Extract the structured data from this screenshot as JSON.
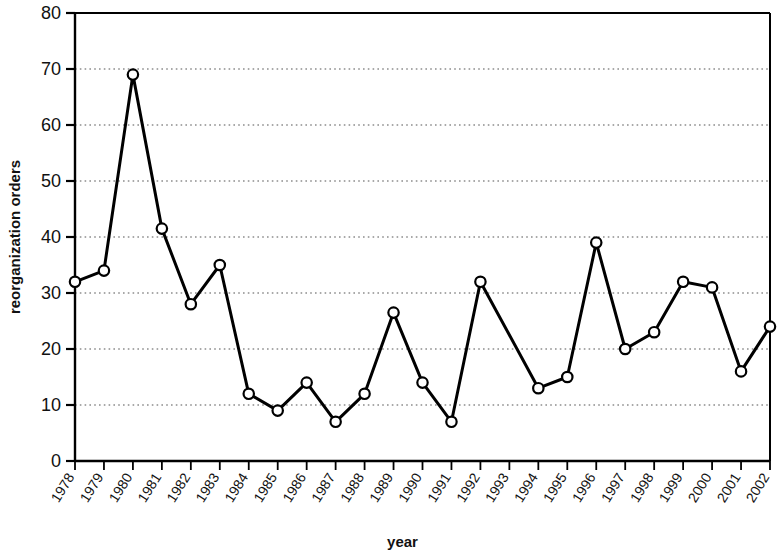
{
  "chart_data": {
    "type": "line",
    "title": "",
    "subtitle": "",
    "xlabel": "year",
    "ylabel": "reorganization orders",
    "x": [
      1978,
      1979,
      1980,
      1981,
      1982,
      1983,
      1984,
      1985,
      1986,
      1987,
      1988,
      1989,
      1990,
      1991,
      1992,
      1993,
      1994,
      1995,
      1996,
      1997,
      1998,
      1999,
      2000,
      2001,
      2002
    ],
    "categories": [
      "1978",
      "1979",
      "1980",
      "1981",
      "1982",
      "1983",
      "1984",
      "1985",
      "1986",
      "1987",
      "1988",
      "1989",
      "1990",
      "1991",
      "1992",
      "1993",
      "1994",
      "1995",
      "1996",
      "1997",
      "1998",
      "1999",
      "2000",
      "2001",
      "2002"
    ],
    "values": [
      32,
      34,
      69,
      41.5,
      28,
      35,
      12,
      9,
      14,
      7,
      12,
      26.5,
      14,
      7,
      32,
      null,
      13,
      15,
      39,
      20,
      23,
      32,
      31,
      16,
      24
    ],
    "series": [
      {
        "name": "reorganization orders",
        "values": [
          32,
          34,
          69,
          41.5,
          28,
          35,
          12,
          9,
          14,
          7,
          12,
          26.5,
          14,
          7,
          32,
          null,
          13,
          15,
          39,
          20,
          23,
          32,
          31,
          16,
          24
        ],
        "marker": "open-circle",
        "line_color": "#000000",
        "marker_fill": "#ffffff"
      }
    ],
    "xlim": [
      1978,
      2002
    ],
    "ylim": [
      0,
      80
    ],
    "yticks": [
      0,
      10,
      20,
      30,
      40,
      50,
      60,
      70,
      80
    ],
    "ytick_labels": [
      "0",
      "10",
      "20",
      "30",
      "40",
      "50",
      "60",
      "70",
      "80"
    ],
    "grid": {
      "horizontal": true,
      "vertical": false,
      "style": "dotted",
      "color": "#555555"
    },
    "legend": {
      "visible": false,
      "position": "none",
      "entries": []
    },
    "annotations": [],
    "colors": {
      "axis": "#000000",
      "line": "#000000",
      "marker_edge": "#000000",
      "marker_face": "#ffffff",
      "background": "#ffffff",
      "text": "#111111"
    }
  }
}
